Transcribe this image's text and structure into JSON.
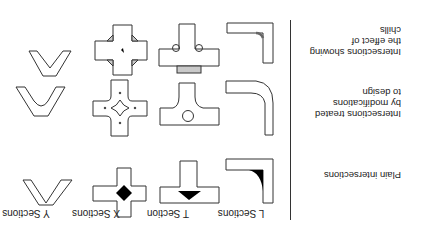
{
  "figure": {
    "orientation": "rotated 180 degrees",
    "columns": [
      {
        "key": "L",
        "label": "L Sections"
      },
      {
        "key": "T",
        "label": "T Section"
      },
      {
        "key": "X",
        "label": "X Sections"
      },
      {
        "key": "Y",
        "label": "Y Sections"
      }
    ],
    "rows": [
      {
        "key": "plain",
        "label": "Plain intersections",
        "feature": "solid black hot spot at junction"
      },
      {
        "key": "modified",
        "label_lines": [
          "Intersections treated",
          "by modifications",
          "to design"
        ],
        "feature": "cored/relieved junctions"
      },
      {
        "key": "chills",
        "label_lines": [
          "Intersections showing",
          "the effect of",
          "chills"
        ],
        "feature": "hatched chills at junctions"
      }
    ],
    "colors": {
      "line": "#333333",
      "hot_spot": "#000000",
      "hatch": "#999999",
      "background": "#ffffff"
    }
  }
}
